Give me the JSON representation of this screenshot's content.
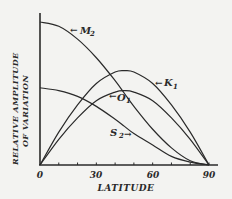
{
  "chart_data": {
    "type": "line",
    "title": "",
    "xlabel": "LATITUDE",
    "ylabel": "RELATIVE AMPLITUDE OF VARIATION",
    "ylabel_line1": "RELATIVE AMPLITUDE",
    "ylabel_line2": "OF VARIATION",
    "x_ticks": [
      "0",
      "30",
      "60",
      "90"
    ],
    "xlim": [
      0,
      90
    ],
    "ylim": [
      0,
      1.05
    ],
    "grid": false,
    "legend": "inline labels",
    "x": [
      0,
      10,
      20,
      30,
      40,
      45,
      50,
      60,
      70,
      80,
      90
    ],
    "series": [
      {
        "name": "M2",
        "label_main": "M",
        "label_sub": "2",
        "values": [
          1.0,
          0.97,
          0.88,
          0.75,
          0.59,
          0.5,
          0.41,
          0.25,
          0.12,
          0.03,
          0.0
        ]
      },
      {
        "name": "K1",
        "label_main": "K",
        "label_sub": "1",
        "values": [
          0.0,
          0.23,
          0.42,
          0.57,
          0.65,
          0.66,
          0.65,
          0.57,
          0.42,
          0.23,
          0.0
        ]
      },
      {
        "name": "O1",
        "label_main": "O",
        "label_sub": "1",
        "values": [
          0.0,
          0.18,
          0.33,
          0.45,
          0.51,
          0.52,
          0.51,
          0.45,
          0.33,
          0.18,
          0.0
        ]
      },
      {
        "name": "S2",
        "label_main": "S",
        "label_sub": "2",
        "values": [
          0.54,
          0.52,
          0.48,
          0.41,
          0.32,
          0.27,
          0.22,
          0.14,
          0.06,
          0.02,
          0.0
        ]
      }
    ]
  }
}
